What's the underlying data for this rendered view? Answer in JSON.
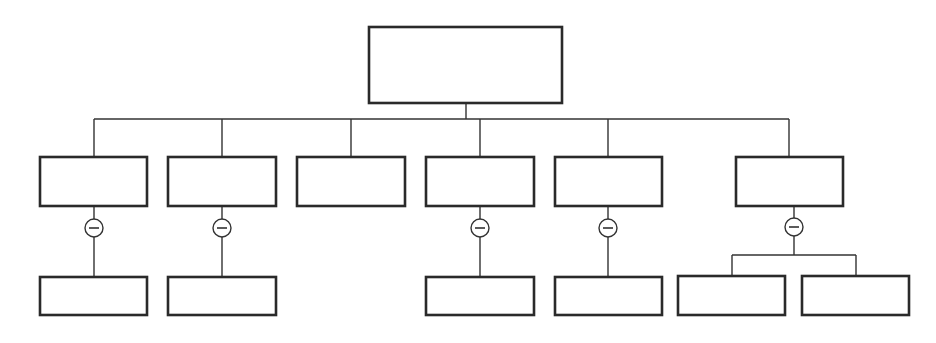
{
  "diagram": {
    "type": "hierarchy-tree",
    "colors": {
      "stroke": "#2a2a2a",
      "background": "#ffffff"
    },
    "root": {
      "id": "root",
      "label": "",
      "x": 369,
      "y": 27,
      "w": 193,
      "h": 76
    },
    "bus_y": 119,
    "root_connector_x": 466,
    "level1": [
      {
        "id": "n1",
        "label": "",
        "x": 40,
        "y": 157,
        "w": 107,
        "h": 49,
        "drop_x": 94,
        "collapse_toggle": true
      },
      {
        "id": "n2",
        "label": "",
        "x": 168,
        "y": 157,
        "w": 108,
        "h": 49,
        "drop_x": 222,
        "collapse_toggle": true
      },
      {
        "id": "n3",
        "label": "",
        "x": 297,
        "y": 157,
        "w": 108,
        "h": 49,
        "drop_x": 351,
        "collapse_toggle": false
      },
      {
        "id": "n4",
        "label": "",
        "x": 426,
        "y": 157,
        "w": 108,
        "h": 49,
        "drop_x": 480,
        "collapse_toggle": true
      },
      {
        "id": "n5",
        "label": "",
        "x": 555,
        "y": 157,
        "w": 107,
        "h": 49,
        "drop_x": 608,
        "collapse_toggle": true
      },
      {
        "id": "n6",
        "label": "",
        "x": 736,
        "y": 157,
        "w": 107,
        "h": 49,
        "drop_x": 789,
        "collapse_toggle": true
      }
    ],
    "toggles": [
      {
        "parent": "n1",
        "cx": 94,
        "cy": 228,
        "r": 9,
        "icon": "minus"
      },
      {
        "parent": "n2",
        "cx": 222,
        "cy": 228,
        "r": 9,
        "icon": "minus"
      },
      {
        "parent": "n4",
        "cx": 480,
        "cy": 228,
        "r": 9,
        "icon": "minus"
      },
      {
        "parent": "n5",
        "cx": 608,
        "cy": 228,
        "r": 9,
        "icon": "minus"
      },
      {
        "parent": "n6",
        "cx": 794,
        "cy": 227,
        "r": 9,
        "icon": "minus"
      }
    ],
    "level2": [
      {
        "id": "n1a",
        "parent": "n1",
        "label": "",
        "x": 40,
        "y": 277,
        "w": 107,
        "h": 38
      },
      {
        "id": "n2a",
        "parent": "n2",
        "label": "",
        "x": 168,
        "y": 277,
        "w": 108,
        "h": 38
      },
      {
        "id": "n4a",
        "parent": "n4",
        "label": "",
        "x": 426,
        "y": 277,
        "w": 108,
        "h": 38
      },
      {
        "id": "n5a",
        "parent": "n5",
        "label": "",
        "x": 555,
        "y": 277,
        "w": 107,
        "h": 38
      },
      {
        "id": "n6a",
        "parent": "n6",
        "label": "",
        "x": 678,
        "y": 276,
        "w": 107,
        "h": 39
      },
      {
        "id": "n6b",
        "parent": "n6",
        "label": "",
        "x": 802,
        "y": 276,
        "w": 107,
        "h": 39
      }
    ],
    "n6_split": {
      "y": 255,
      "x1": 732,
      "x2": 856
    }
  }
}
